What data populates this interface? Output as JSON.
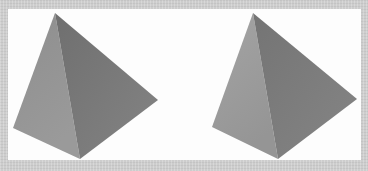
{
  "figure": {
    "background": "#d2d2d2",
    "panel_color": "#fdfdfd",
    "objects": [
      {
        "name": "pyramid-left",
        "apex": [
          55,
          13
        ],
        "left": [
          13,
          128
        ],
        "bottom": [
          80,
          159
        ],
        "right": [
          158,
          100
        ],
        "face_left_color": "#8c8c8c",
        "face_right_color": "#7a7a7a"
      },
      {
        "name": "pyramid-right",
        "apex": [
          253,
          13
        ],
        "left": [
          212,
          127
        ],
        "bottom": [
          278,
          159
        ],
        "right": [
          357,
          99
        ],
        "face_left_color": "#9a9a9a",
        "face_right_color": "#7c7c7c"
      }
    ]
  }
}
